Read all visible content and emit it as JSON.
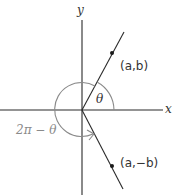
{
  "diagram": {
    "axes": {
      "x_label": "x",
      "y_label": "y"
    },
    "points": [
      {
        "id": "upper",
        "label": "(a,b)"
      },
      {
        "id": "lower",
        "label": "(a,−b)"
      }
    ],
    "angles": {
      "theta_label": "θ",
      "reflex_label": "2π − θ"
    },
    "colors": {
      "line": "#2a2a2a",
      "arc": "#8a8a8a",
      "label": "#333333",
      "reflex_label": "#8a8a8a"
    }
  }
}
